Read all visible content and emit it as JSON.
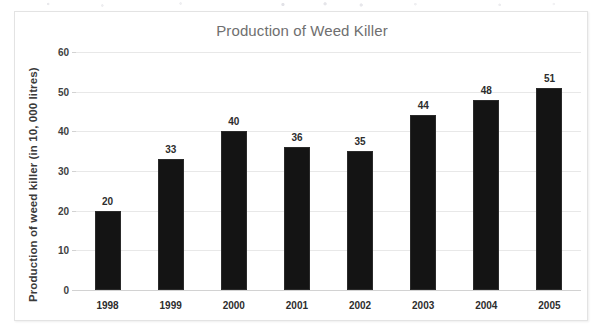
{
  "chart_data": {
    "type": "bar",
    "title": "Production of Weed Killer",
    "xlabel": "",
    "ylabel": "Production of weed killer (in 10, 000 litres)",
    "categories": [
      "1998",
      "1999",
      "2000",
      "2001",
      "2002",
      "2003",
      "2004",
      "2005"
    ],
    "values": [
      20,
      33,
      40,
      36,
      35,
      44,
      48,
      51
    ],
    "series": [
      {
        "name": "Production of weed killer",
        "values": [
          20,
          33,
          40,
          36,
          35,
          44,
          48,
          51
        ]
      }
    ],
    "data_labels": [
      "20",
      "33",
      "40",
      "36",
      "35",
      "44",
      "48",
      "51"
    ],
    "ylim": [
      0,
      60
    ],
    "ytick_values": [
      0,
      10,
      20,
      30,
      40,
      50,
      60
    ],
    "ytick_labels": [
      "0",
      "10",
      "20",
      "30",
      "40",
      "50",
      "60"
    ],
    "grid": true,
    "legend": false,
    "legend_position": "none",
    "bar_color": "#141414",
    "grid_color": "#e8e8e8",
    "title_color": "#6f6f6f",
    "label_color": "#2d2d2d",
    "frame_border_color": "#e3e3e3",
    "background_color": "#ffffff"
  }
}
